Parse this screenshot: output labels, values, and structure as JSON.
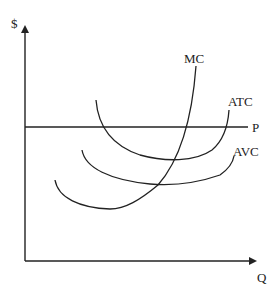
{
  "diagram": {
    "axes": {
      "y_label": "$",
      "x_label": "Q"
    },
    "curves": [
      {
        "name": "MC",
        "label": "MC",
        "description": "Marginal cost, U-shaped, rising steeply"
      },
      {
        "name": "ATC",
        "label": "ATC",
        "description": "Average total cost, U-shaped"
      },
      {
        "name": "AVC",
        "label": "AVC",
        "description": "Average variable cost, U-shaped, below ATC"
      },
      {
        "name": "P",
        "label": "P",
        "description": "Horizontal price line"
      }
    ],
    "colors": {
      "line": "#222222",
      "background": "#ffffff"
    }
  }
}
